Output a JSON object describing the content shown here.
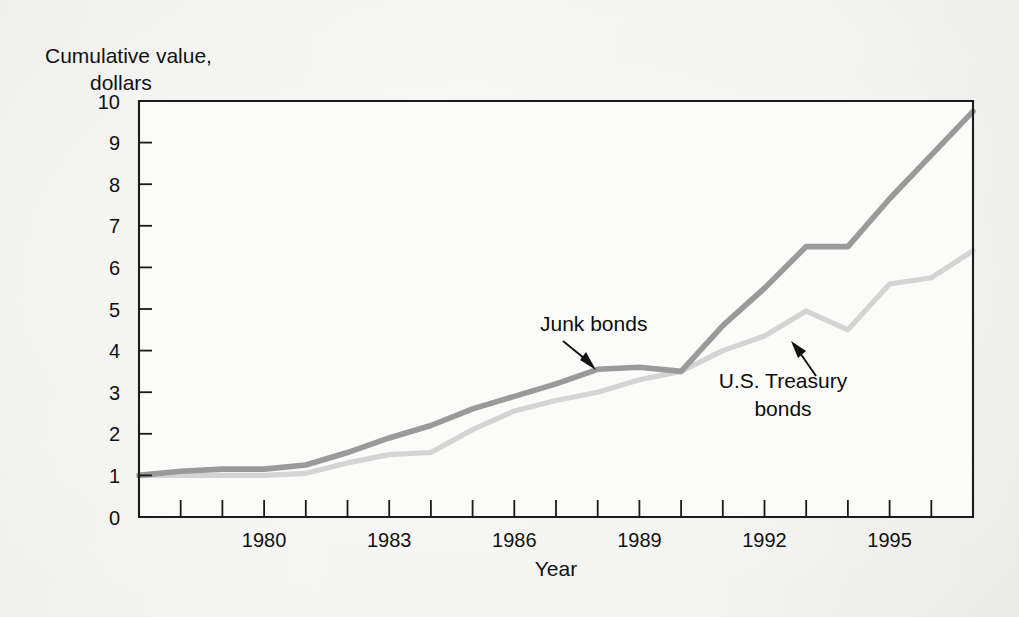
{
  "figure": {
    "y_axis_title_line1": "Cumulative value,",
    "y_axis_title_line2": "dollars",
    "x_axis_title": "Year"
  },
  "annotations": [
    {
      "id": "junk-bonds",
      "text": "Junk bonds",
      "text_x": 540,
      "text_y": 331,
      "anchor": "start",
      "tail_x": 563,
      "tail_y": 341,
      "head_x": 596,
      "head_y": 368
    },
    {
      "id": "treasury-bonds",
      "line1": "U.S. Treasury",
      "line2": "bonds",
      "text_x": 783,
      "text_y": 388,
      "text2_y": 416,
      "anchor": "middle",
      "tail_x": 816,
      "tail_y": 376,
      "head_x": 793,
      "head_y": 343
    }
  ],
  "colors": {
    "junk_bonds_line": "#9a9a9a",
    "treasury_line": "#d4d4d4",
    "axis": "#1b1b1b",
    "text": "#111111",
    "page_background": "#f3f3f1",
    "plot_background": "#fbfbfa"
  },
  "chart_data": {
    "type": "line",
    "title": "",
    "xlabel": "Year",
    "ylabel": "Cumulative value, dollars",
    "xlim": [
      1977,
      1997
    ],
    "ylim": [
      0,
      10
    ],
    "grid": false,
    "legend": "annotations-inline",
    "y_ticks": [
      0,
      1,
      2,
      3,
      4,
      5,
      6,
      7,
      8,
      9,
      10
    ],
    "y_ticklabels": [
      "0",
      "1",
      "2",
      "3",
      "4",
      "5",
      "6",
      "7",
      "8",
      "9",
      "10"
    ],
    "x_ticks": [
      1977,
      1978,
      1979,
      1980,
      1981,
      1982,
      1983,
      1984,
      1985,
      1986,
      1987,
      1988,
      1989,
      1990,
      1991,
      1992,
      1993,
      1994,
      1995,
      1996,
      1997
    ],
    "x_ticklabels_shown": [
      "1980",
      "1983",
      "1986",
      "1989",
      "1992",
      "1995"
    ],
    "x_ticklabel_values": [
      1980,
      1983,
      1986,
      1989,
      1992,
      1995
    ],
    "x": [
      1977,
      1978,
      1979,
      1980,
      1981,
      1982,
      1983,
      1984,
      1985,
      1986,
      1987,
      1988,
      1989,
      1990,
      1991,
      1992,
      1993,
      1994,
      1995,
      1996,
      1997
    ],
    "series": [
      {
        "name": "Junk bonds",
        "color": "#9a9a9a",
        "values": [
          1.0,
          1.1,
          1.15,
          1.15,
          1.25,
          1.55,
          1.9,
          2.2,
          2.6,
          2.9,
          3.2,
          3.55,
          3.6,
          3.5,
          4.6,
          5.5,
          6.5,
          6.5,
          7.65,
          8.7,
          9.75
        ]
      },
      {
        "name": "U.S. Treasury bonds",
        "color": "#d4d4d4",
        "values": [
          1.0,
          1.0,
          1.0,
          1.0,
          1.05,
          1.3,
          1.5,
          1.55,
          2.1,
          2.55,
          2.8,
          3.0,
          3.3,
          3.5,
          4.0,
          4.35,
          4.95,
          4.5,
          5.6,
          5.75,
          6.4
        ]
      }
    ]
  }
}
